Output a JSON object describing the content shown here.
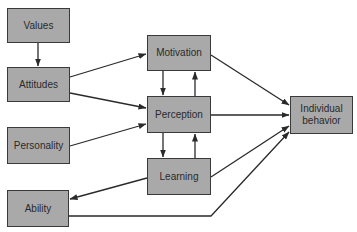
{
  "diagram": {
    "type": "flow",
    "colors": {
      "node_fill": "#a9a9a9",
      "node_border": "#3a3a3a",
      "edge": "#2a2a2a",
      "background": "#ffffff"
    },
    "nodes": [
      {
        "id": "values",
        "label": "Values"
      },
      {
        "id": "attitudes",
        "label": "Attitudes"
      },
      {
        "id": "personality",
        "label": "Personality"
      },
      {
        "id": "ability",
        "label": "Ability"
      },
      {
        "id": "motivation",
        "label": "Motivation"
      },
      {
        "id": "perception",
        "label": "Perception"
      },
      {
        "id": "learning",
        "label": "Learning"
      },
      {
        "id": "individual_behavior",
        "label": "Individual behavior"
      }
    ],
    "edges": [
      {
        "from": "values",
        "to": "attitudes"
      },
      {
        "from": "attitudes",
        "to": "motivation"
      },
      {
        "from": "attitudes",
        "to": "perception"
      },
      {
        "from": "personality",
        "to": "perception"
      },
      {
        "from": "motivation",
        "to": "perception"
      },
      {
        "from": "perception",
        "to": "motivation"
      },
      {
        "from": "perception",
        "to": "learning"
      },
      {
        "from": "learning",
        "to": "perception"
      },
      {
        "from": "learning",
        "to": "ability"
      },
      {
        "from": "motivation",
        "to": "individual_behavior"
      },
      {
        "from": "perception",
        "to": "individual_behavior"
      },
      {
        "from": "learning",
        "to": "individual_behavior"
      },
      {
        "from": "ability",
        "to": "individual_behavior"
      }
    ]
  }
}
